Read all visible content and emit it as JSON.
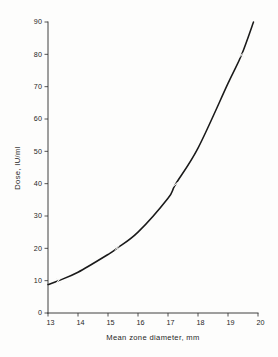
{
  "figure": {
    "background_color": "#fdfdfc",
    "ink_color": "#1a1a1a"
  },
  "chart_data": {
    "type": "line",
    "title": "",
    "subtitle": "",
    "xlabel": "Mean zone diameter, mm",
    "ylabel": "Dose, IU/ml",
    "xlim": [
      13,
      20
    ],
    "ylim": [
      0,
      90
    ],
    "xticks": [
      13,
      14,
      15,
      16,
      17,
      18,
      19,
      20
    ],
    "xticklabels": [
      "13",
      "14",
      "15",
      "16",
      "17",
      "18",
      "19",
      "20"
    ],
    "yticks": [
      0,
      10,
      20,
      30,
      40,
      50,
      60,
      70,
      80,
      90
    ],
    "yticklabels": [
      "0",
      "10",
      "20",
      "30",
      "40",
      "50",
      "60",
      "70",
      "80",
      "90"
    ],
    "grid": false,
    "legend": false,
    "legend_position": "none",
    "annotations": [],
    "series": [
      {
        "name": "Dose response curve",
        "style": "solid-line",
        "marker": "x",
        "x": [
          13.0,
          13.35,
          14.0,
          15.0,
          15.3,
          16.0,
          17.0,
          17.25,
          18.0,
          19.0,
          19.45,
          19.85
        ],
        "y": [
          8.8,
          10.0,
          12.6,
          18.1,
          20.0,
          25.0,
          35.5,
          39.8,
          51.0,
          71.0,
          79.8,
          90.0
        ]
      }
    ],
    "data_points": [
      {
        "x": 13.35,
        "y": 10.0,
        "marker": "x"
      },
      {
        "x": 15.3,
        "y": 20.0,
        "marker": "x"
      },
      {
        "x": 17.25,
        "y": 39.8,
        "marker": "x"
      },
      {
        "x": 19.45,
        "y": 79.8,
        "marker": "x"
      }
    ]
  }
}
